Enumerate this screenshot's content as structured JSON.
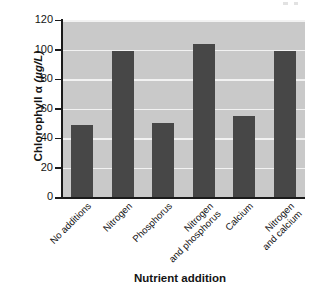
{
  "chart_data": {
    "type": "bar",
    "title": "",
    "xlabel": "Nutrient addition",
    "ylabel": "Chlorophyll α (µg/L)",
    "ylabel_parts": {
      "prefix": "Chlorophyll ",
      "symbol": "α",
      "units": " (µg/L)"
    },
    "categories": [
      "No additions",
      "Nitrogen",
      "Phosphorus",
      "Nitrogen and phosphorus",
      "Calcium",
      "Nitrogen and calcium"
    ],
    "category_lines": [
      [
        "No additions"
      ],
      [
        "Nitrogen"
      ],
      [
        "Phosphorus"
      ],
      [
        "Nitrogen",
        "and phosphorus"
      ],
      [
        "Calcium"
      ],
      [
        "Nitrogen",
        "and calcium"
      ]
    ],
    "values": [
      49,
      99,
      50,
      104,
      55,
      99
    ],
    "ylim": [
      0,
      120
    ],
    "yticks": [
      0,
      20,
      40,
      60,
      80,
      100,
      120
    ],
    "ytick_labels": [
      "0",
      "20",
      "40",
      "60",
      "80",
      "100",
      "120"
    ],
    "grid": "horizontal",
    "legend": "none",
    "colors": {
      "bar": "#474747",
      "plot_background": "#c9c9c9",
      "gridline": "#f2f2f2",
      "axis": "#1a1a1a",
      "text": "#141414",
      "page_background": "#ffffff"
    }
  }
}
